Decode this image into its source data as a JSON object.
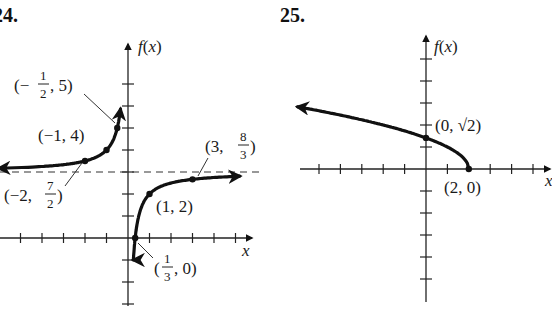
{
  "chart_data": [
    {
      "type": "line",
      "problem_number": "24.",
      "ylabel": "f(x)",
      "xlabel": "x",
      "function": "f(x) = 3 - 1/x",
      "xlim": [
        -6,
        5.5
      ],
      "ylim": [
        -3,
        7
      ],
      "tick_step": 1,
      "grid": false,
      "asymptotes": {
        "vertical": 0,
        "horizontal": 3
      },
      "series": [
        {
          "name": "left-branch",
          "x_range": [
            -6,
            -0.35
          ]
        },
        {
          "name": "right-branch",
          "x_range": [
            0.25,
            5.2
          ]
        }
      ],
      "points": [
        {
          "x": -0.5,
          "y": 5,
          "label": [
            "(−",
            "1",
            "2",
            ", 5)"
          ]
        },
        {
          "x": -1,
          "y": 4,
          "label": "(−1, 4)"
        },
        {
          "x": -2,
          "y": 3.5,
          "label": [
            "(−2, ",
            "7",
            "2",
            ")"
          ]
        },
        {
          "x": 1,
          "y": 2,
          "label": "(1, 2)"
        },
        {
          "x": 3,
          "y": 2.6667,
          "label": [
            "(3, ",
            "8",
            "3",
            ")"
          ]
        },
        {
          "x": 0.3333,
          "y": 0,
          "label": [
            "(",
            "1",
            "3",
            ", 0)"
          ]
        }
      ]
    },
    {
      "type": "line",
      "problem_number": "25.",
      "ylabel": "f(x)",
      "xlabel": "x",
      "function": "f(x) = sqrt(2 - x)",
      "xlim": [
        -6,
        5.5
      ],
      "ylim": [
        -5,
        5
      ],
      "tick_step": 1,
      "grid": false,
      "series": [
        {
          "name": "sqrt-curve",
          "x_range": [
            -6,
            2
          ]
        }
      ],
      "points": [
        {
          "x": 0,
          "y": 1.4142,
          "label": "(0, √2)"
        },
        {
          "x": 2,
          "y": 0,
          "label": "(2, 0)"
        }
      ]
    }
  ]
}
